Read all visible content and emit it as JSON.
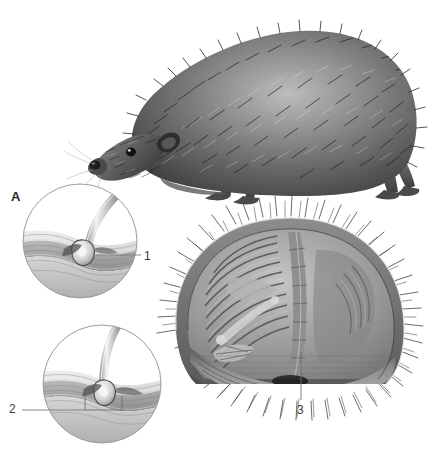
{
  "plate": {
    "title": "Hedgehog spine and body-wall anatomy plate",
    "background_color": "#ffffff",
    "width": 433,
    "height": 452
  },
  "figures": {
    "habitus": {
      "name": "hedgehog-lateral-view",
      "description": "Lateral view of a hedgehog standing, covered in spines",
      "tone_dark": "#2f2f2f",
      "tone_mid": "#8a8a8a",
      "tone_light": "#d8d8d8"
    },
    "cross_section": {
      "name": "rolled-hedgehog-cross-section",
      "description": "Transverse section through a rolled-up hedgehog showing ribs, vertebral column and the panniculus carnosus muscle beneath the spiny skin",
      "rim_tone": "#6f6f6f",
      "cavity_tone": "#9a9a9a",
      "muscle_tone": "#707070"
    },
    "inset_top": {
      "name": "spine-follicle-detail-relaxed",
      "description": "Circular magnified detail of a single spine rooted in the skin layers, spine inclined",
      "border_color": "#9b9b9b"
    },
    "inset_bottom": {
      "name": "spine-follicle-detail-erect",
      "description": "Circular magnified detail of a single spine erected by muscle action with bracket marking the follicle base",
      "border_color": "#9b9b9b"
    }
  },
  "callouts": [
    {
      "id": "A",
      "label": "A",
      "kind": "panel-letter",
      "x": 11,
      "y": 190
    },
    {
      "id": "1",
      "label": "1",
      "kind": "number",
      "x": 144,
      "y": 250
    },
    {
      "id": "2",
      "label": "2",
      "kind": "number",
      "x": 9,
      "y": 403
    },
    {
      "id": "3",
      "label": "3",
      "kind": "number",
      "x": 297,
      "y": 404
    }
  ],
  "leader_lines": {
    "line_1": "short horizontal rule from spine follicle to numeral 1",
    "line_2": "long horizontal rule from numeral 2 to a rectangular bracket under the follicle",
    "line_3": "vertical rule from numeral 3 up into the muscle layer of the cross-section"
  },
  "colors": {
    "ink": "#3a3a3a",
    "leader": "#7a7a7a",
    "circle_stroke": "#9b9b9b",
    "paper": "#ffffff"
  }
}
